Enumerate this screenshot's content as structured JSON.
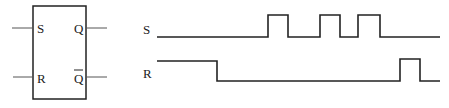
{
  "flipflop": {
    "inputs": [
      {
        "label": "S"
      },
      {
        "label": "R"
      }
    ],
    "outputs": [
      {
        "label": "Q"
      },
      {
        "label": "Q̄"
      }
    ]
  },
  "waveforms": {
    "signals": [
      {
        "label": "S",
        "edges_x": [
          157,
          268,
          288,
          320,
          340,
          358,
          380,
          440
        ],
        "initial": "low"
      },
      {
        "label": "R",
        "edges_x": [
          157,
          217,
          400,
          420,
          440
        ],
        "initial": "high"
      }
    ]
  },
  "colors": {
    "line": "#222222",
    "background": "#ffffff"
  }
}
